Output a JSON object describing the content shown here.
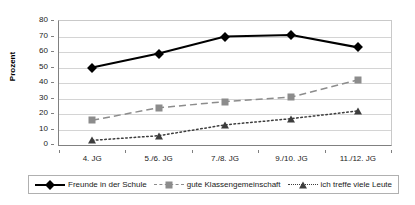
{
  "chart_data": {
    "type": "line",
    "title": "",
    "xlabel": "",
    "ylabel": "Prozent",
    "ylim": [
      0,
      80
    ],
    "yticks": [
      0,
      10,
      20,
      30,
      40,
      50,
      60,
      70,
      80
    ],
    "grid": true,
    "legend_position": "bottom",
    "categories": [
      "4. JG",
      "5./6. JG",
      "7./8. JG",
      "9./10. JG",
      "11./12. JG"
    ],
    "series": [
      {
        "name": "Freunde in der Schule",
        "marker": "diamond",
        "color": "#000000",
        "line_style": "solid",
        "values": [
          50,
          59,
          70,
          71,
          63
        ]
      },
      {
        "name": "gute Klassengemeinschaft",
        "marker": "square",
        "color": "#8c8c8c",
        "line_style": "dashed",
        "values": [
          16,
          24,
          28,
          31,
          42
        ]
      },
      {
        "name": "ich treffe viele Leute",
        "marker": "triangle",
        "color": "#3d3d3d",
        "line_style": "dotted",
        "values": [
          3,
          6,
          13,
          17,
          22
        ]
      }
    ]
  },
  "axis": {
    "y_title": "Prozent"
  },
  "legend": {
    "items": [
      {
        "label": "Freunde in der Schule"
      },
      {
        "label": "gute Klassengemeinschaft"
      },
      {
        "label": "ich treffe viele Leute"
      }
    ]
  }
}
